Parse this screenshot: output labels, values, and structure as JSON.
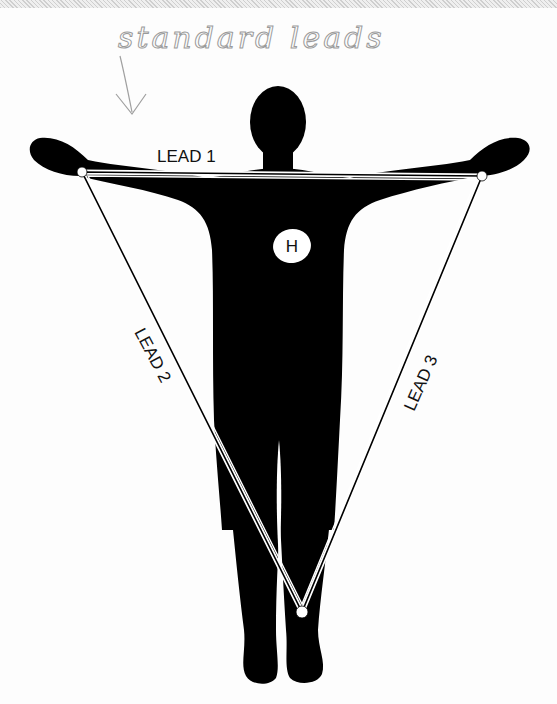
{
  "diagram": {
    "annotation": {
      "handwritten_note": "standard leads",
      "arrow": "hand-drawn-arrow-down"
    },
    "leads": [
      {
        "id": "lead1",
        "label": "LEAD 1",
        "from": "right-arm",
        "to": "left-arm"
      },
      {
        "id": "lead2",
        "label": "LEAD 2",
        "from": "right-arm",
        "to": "left-leg"
      },
      {
        "id": "lead3",
        "label": "LEAD 3",
        "from": "left-arm",
        "to": "left-leg"
      }
    ],
    "heart": {
      "label": "H"
    },
    "electrodes": [
      "right-arm",
      "left-arm",
      "left-leg"
    ],
    "colors": {
      "silhouette": "#000000",
      "background": "#ffffff",
      "lines": "#000000",
      "handwriting": "#9a9a9a"
    }
  }
}
